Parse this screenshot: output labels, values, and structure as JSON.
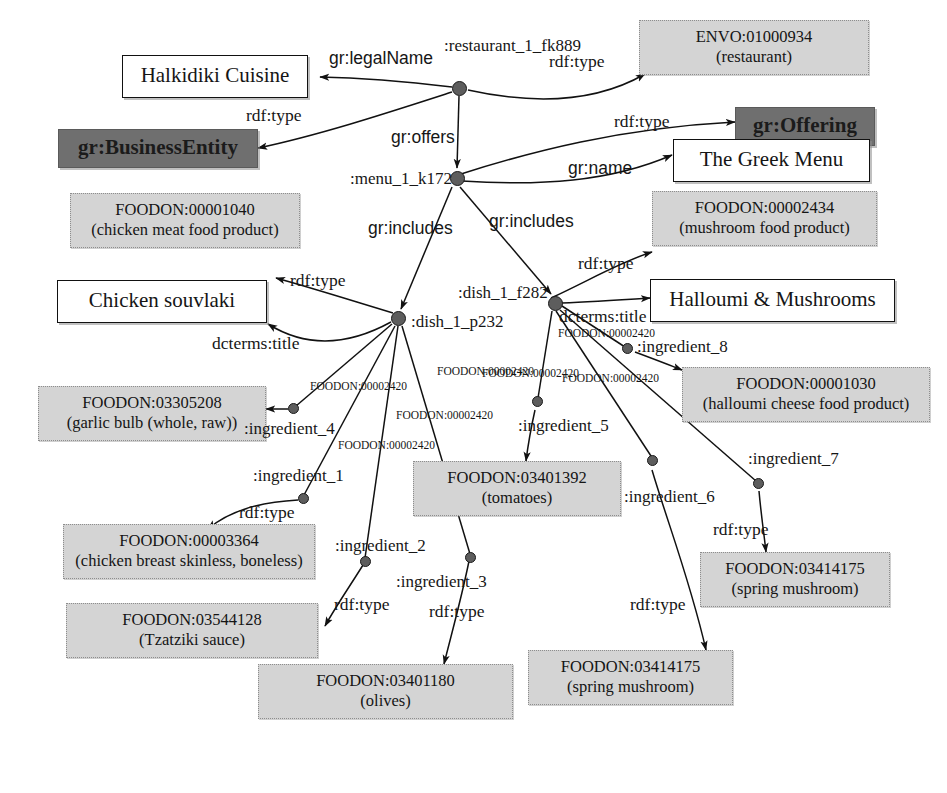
{
  "diagram": {
    "type": "rdf-graph"
  },
  "nodes": {
    "restaurant_bnode": {
      "id": ":restaurant_1_fk889"
    },
    "menu_bnode": {
      "id": ":menu_1_k172"
    },
    "dish_p232_bnode": {
      "id": ":dish_1_p232"
    },
    "dish_f282_bnode": {
      "id": ":dish_1_f282"
    },
    "ingredient_1": {
      "id": ":ingredient_1"
    },
    "ingredient_2": {
      "id": ":ingredient_2"
    },
    "ingredient_3": {
      "id": ":ingredient_3"
    },
    "ingredient_4": {
      "id": ":ingredient_4"
    },
    "ingredient_5": {
      "id": ":ingredient_5"
    },
    "ingredient_6": {
      "id": ":ingredient_6"
    },
    "ingredient_7": {
      "id": ":ingredient_7"
    },
    "ingredient_8": {
      "id": ":ingredient_8"
    }
  },
  "boxes": {
    "halkidiki_cuisine": {
      "line1": "Halkidiki Cuisine",
      "line2": ""
    },
    "envo_restaurant": {
      "line1": "ENVO:01000934",
      "line2": "(restaurant)"
    },
    "gr_business_entity": {
      "line1": "gr:BusinessEntity",
      "line2": ""
    },
    "gr_offering": {
      "line1": "gr:Offering",
      "line2": ""
    },
    "the_greek_menu": {
      "line1": "The Greek Menu",
      "line2": ""
    },
    "foodon_chicken_meat": {
      "line1": "FOODON:00001040",
      "line2": "(chicken meat food product)"
    },
    "foodon_mushroom_product": {
      "line1": "FOODON:00002434",
      "line2": "(mushroom food product)"
    },
    "chicken_souvlaki": {
      "line1": "Chicken souvlaki",
      "line2": ""
    },
    "halloumi_mushrooms": {
      "line1": "Halloumi & Mushrooms",
      "line2": ""
    },
    "foodon_garlic_bulb": {
      "line1": "FOODON:03305208",
      "line2": "(garlic bulb (whole, raw))"
    },
    "foodon_halloumi_cheese": {
      "line1": "FOODON:00001030",
      "line2": "(halloumi cheese food product)"
    },
    "foodon_chicken_breast": {
      "line1": "FOODON:00003364",
      "line2": "(chicken breast skinless, boneless)"
    },
    "foodon_tomatoes": {
      "line1": "FOODON:03401392",
      "line2": "(tomatoes)"
    },
    "foodon_spring_mushroom_right": {
      "line1": "FOODON:03414175",
      "line2": "(spring mushroom)"
    },
    "foodon_tzatziki": {
      "line1": "FOODON:03544128",
      "line2": "(Tzatziki sauce)"
    },
    "foodon_spring_mushroom_bottom": {
      "line1": "FOODON:03414175",
      "line2": "(spring mushroom)"
    },
    "foodon_olives": {
      "line1": "FOODON:03401180",
      "line2": "(olives)"
    }
  },
  "edge_labels": {
    "gr_legal_name": "gr:legalName",
    "rdf_type_business_entity": "rdf:type",
    "rdf_type_restaurant": "rdf:type",
    "gr_offers": "gr:offers",
    "rdf_type_offering": "rdf:type",
    "gr_name": "gr:name",
    "gr_includes_left": "gr:includes",
    "gr_includes_right": "gr:includes",
    "rdf_type_chicken_meat": "rdf:type",
    "dcterms_title_souvlaki": "dcterms:title",
    "rdf_type_mushroom_product": "rdf:type",
    "dcterms_title_halloumi": "dcterms:title",
    "has_ingredient_p232_a": "FOODON:00002420",
    "has_ingredient_p232_b": "FOODON:00002420",
    "has_ingredient_p232_c": "FOODON:00002420",
    "has_ingredient_p232_d": "FOODON:00002420",
    "has_ingredient_f282_a": "FOODON:00002420",
    "has_ingredient_f282_b": "FOODON:00002420",
    "has_ingredient_f282_c": "FOODON:00002420",
    "rdf_type_ingredient_1": "rdf:type",
    "rdf_type_ingredient_2": "rdf:type",
    "rdf_type_ingredient_3": "rdf:type",
    "rdf_type_ingredient_6": "rdf:type",
    "rdf_type_ingredient_7": "rdf:type"
  },
  "colors": {
    "onto_fill": "#d4d4d4",
    "vocab_fill": "#6f6f6f",
    "literal_fill": "#ffffff",
    "stroke": "#111111",
    "bnode_fill": "#5d5d5d"
  }
}
